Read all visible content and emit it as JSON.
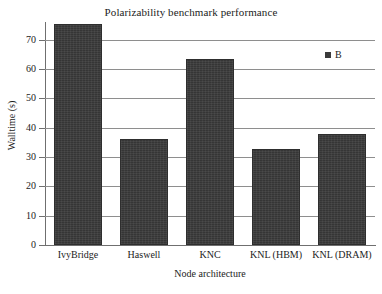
{
  "chart_data": {
    "type": "bar",
    "title": "Polarizability benchmark performance",
    "xlabel": "Node architecture",
    "ylabel": "Walltime (s)",
    "categories": [
      "IvyBridge",
      "Haswell",
      "KNC",
      "KNL (HBM)",
      "KNL (DRAM)"
    ],
    "values": [
      75.4,
      36.0,
      63.5,
      32.7,
      38.0
    ],
    "series": [
      {
        "name": "B",
        "values": [
          75.4,
          36.0,
          63.5,
          32.7,
          38.0
        ],
        "color": "#3b3b3b"
      }
    ],
    "ylim": [
      0,
      76
    ],
    "yticks": [
      0,
      10,
      20,
      30,
      40,
      50,
      60,
      70
    ],
    "ytick_labels": [
      "0",
      "10",
      "20",
      "30",
      "40",
      "50",
      "60",
      "70"
    ],
    "grid": "horizontal",
    "legend": {
      "position": "top-right",
      "entries": [
        {
          "label": "B",
          "marker": "square",
          "color": "#3b3b3b"
        }
      ]
    },
    "colors": {
      "bar": "#3b3b3b",
      "grid": "#8e8e8e",
      "axis": "#6f6f6f",
      "text": "#1c1c1c",
      "background": "#ffffff"
    }
  }
}
